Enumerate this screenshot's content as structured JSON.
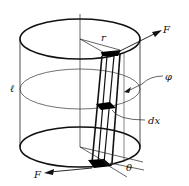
{
  "figure": {
    "labels": {
      "force_top": "F",
      "force_bottom": "F",
      "radius": "r",
      "length": "ℓ",
      "angle_twist": "φ",
      "element_length": "dx",
      "shear_angle": "θ"
    },
    "colors": {
      "line": "#111111",
      "background": "#ffffff"
    }
  }
}
